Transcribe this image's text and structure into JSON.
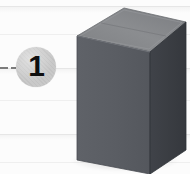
{
  "scene": {
    "title": "Step 1 instruction illustration",
    "width": 190,
    "height": 174,
    "background_color": "#fcfcfc"
  },
  "background": {
    "name": "ruled-plank-surface",
    "line_color": "#e6e6e6",
    "soft_line_color": "#efefef",
    "lines_y": [
      6,
      34,
      68,
      100,
      134,
      162
    ]
  },
  "leader": {
    "name": "leader-dash",
    "color": "#7c7c7c",
    "segments": [
      {
        "x": 0,
        "y": 67,
        "width": 8
      },
      {
        "x": 11,
        "y": 67,
        "width": 5
      }
    ]
  },
  "badge": {
    "name": "step-number-badge",
    "number": "1",
    "fill_color": "#c9c9c9",
    "text_color": "#0e0e0e",
    "x": 16,
    "y": 47,
    "diameter": 40
  },
  "box": {
    "name": "cardboard-box-3d",
    "front_color": "#5a5d63",
    "top_color": "#8a8c8f",
    "side_color": "#3a3d42",
    "front_edge_color": "#4c4f55",
    "top_edge_color": "#6f7174",
    "top_lip_color": "#74767a",
    "outline_color": "#2e3035",
    "faces": {
      "front": "77,36 150,52 150,174 77,160",
      "top": "77,36 124,8 186,22 150,52",
      "side": "150,52 186,22 186,150 150,174"
    }
  },
  "shadow": {
    "name": "floor-shadow",
    "color": "rgba(0,0,0,0.16)"
  }
}
